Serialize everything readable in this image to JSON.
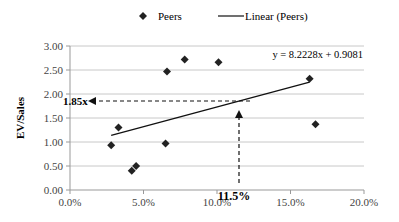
{
  "chart_data": {
    "type": "scatter",
    "title": "",
    "xlabel": "",
    "ylabel": "EV/Sales",
    "xlim": [
      0,
      0.2
    ],
    "ylim": [
      0,
      3.0
    ],
    "x_ticks": [
      "0.0%",
      "5.0%",
      "10.0%",
      "15.0%",
      "20.0%"
    ],
    "y_ticks": [
      "0.00",
      "0.50",
      "1.00",
      "1.50",
      "2.00",
      "2.50",
      "3.00"
    ],
    "grid": {
      "horizontal": true,
      "vertical": false
    },
    "legend": {
      "position": "top",
      "entries": [
        "Peers",
        "Linear (Peers)"
      ]
    },
    "series": [
      {
        "name": "Peers",
        "marker": "diamond",
        "points": [
          {
            "x": 0.028,
            "y": 0.93
          },
          {
            "x": 0.033,
            "y": 1.3
          },
          {
            "x": 0.042,
            "y": 0.4
          },
          {
            "x": 0.045,
            "y": 0.5
          },
          {
            "x": 0.065,
            "y": 0.97
          },
          {
            "x": 0.066,
            "y": 2.47
          },
          {
            "x": 0.078,
            "y": 2.72
          },
          {
            "x": 0.101,
            "y": 2.66
          },
          {
            "x": 0.163,
            "y": 2.32
          },
          {
            "x": 0.167,
            "y": 1.37
          }
        ]
      },
      {
        "name": "Linear (Peers)",
        "type": "line",
        "slope": 8.2228,
        "intercept": 0.9081,
        "x_range": [
          0.028,
          0.163
        ]
      }
    ],
    "annotations": [
      {
        "text": "y = 8.2228x + 0.9081",
        "type": "equation"
      },
      {
        "text": "1.85x",
        "type": "dashed-arrow-left",
        "y": 1.85,
        "from_x": 0.115
      },
      {
        "text": "11.5%",
        "type": "dashed-arrow-up",
        "x": 0.115,
        "to_y": 1.85
      }
    ]
  },
  "legend": {
    "peers": "Peers",
    "linear": "Linear (Peers)"
  },
  "axis": {
    "ylabel": "EV/Sales"
  },
  "annotations": {
    "equation": "y = 8.2228x + 0.9081",
    "implied_multiple": "1.85x",
    "implied_margin": "11.5%"
  }
}
